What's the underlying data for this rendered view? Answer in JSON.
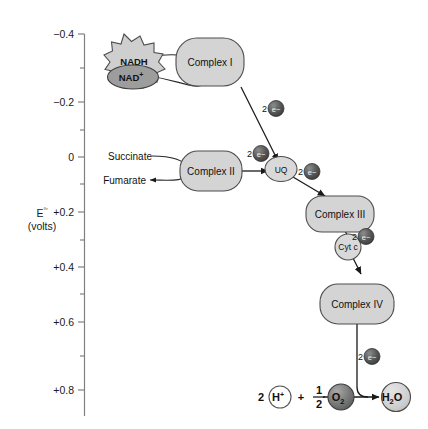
{
  "figure": {
    "background_color": "#ffffff"
  },
  "axis": {
    "label_line1": "E",
    "label_superscript": "°′",
    "label_line2": "(volts)",
    "tick_labels": [
      "−0.4",
      "−0.2",
      "0",
      "+0.2",
      "+0.4",
      "+0.6",
      "+0.8"
    ],
    "tick_values": [
      -0.4,
      -0.2,
      0,
      0.2,
      0.4,
      0.6,
      0.8
    ],
    "minor_ticks": [
      -0.3,
      -0.1,
      0.1,
      0.3,
      0.5,
      0.7,
      0.9
    ],
    "range": [
      -0.45,
      0.92
    ],
    "axis_color": "#808080"
  },
  "nodes": {
    "nadh": {
      "label": "NADH",
      "shape": "starburst",
      "fill": "#cfcfcf"
    },
    "nad": {
      "label": "NAD",
      "superscript": "+",
      "shape": "ellipse",
      "fill": "#9d9d9d"
    },
    "complex1": {
      "label": "Complex I",
      "shape": "rounded-rect",
      "fill": "#d4d4d4"
    },
    "succinate": {
      "label": "Succinate"
    },
    "fumarate": {
      "label": "Fumarate"
    },
    "complex2": {
      "label": "Complex II",
      "shape": "rounded-rect",
      "fill": "#d4d4d4"
    },
    "uq": {
      "label": "UQ",
      "shape": "ellipse",
      "fill": "#d9d9d9"
    },
    "complex3": {
      "label": "Complex III",
      "shape": "rounded-rect",
      "fill": "#d4d4d4"
    },
    "cytc": {
      "label": "Cyt c",
      "shape": "circle",
      "fill": "#d9d9d9"
    },
    "complex4": {
      "label": "Complex IV",
      "shape": "rounded-rect",
      "fill": "#d4d4d4"
    }
  },
  "electron_labels": {
    "complex1_to_uq": {
      "count": "2",
      "glyph": "e−"
    },
    "complex2_to_uq": {
      "count": "2",
      "glyph": "e−"
    },
    "uq_to_complex3": {
      "count": "2",
      "glyph": "e−"
    },
    "complex3_to_cytc": {
      "count": "2",
      "glyph": "e−"
    },
    "complex4_to_water": {
      "count": "2",
      "glyph": "e−"
    }
  },
  "equation": {
    "h_coefficient": "2",
    "h_label": "H",
    "h_charge": "+",
    "plus": "+",
    "fraction_numerator": "1",
    "fraction_denominator": "2",
    "oxygen_label": "O",
    "oxygen_subscript": "2",
    "water_label": "H",
    "water_subscript": "2",
    "water_label_tail": "O"
  },
  "colors": {
    "complex_fill": "#d4d4d4",
    "complex_stroke": "#4d4d4d",
    "electron_fill": "#555555",
    "nad_fill": "#9d9d9d",
    "o2_fill": "#7d7d7d",
    "arrow_stroke": "#1a1a1a"
  }
}
